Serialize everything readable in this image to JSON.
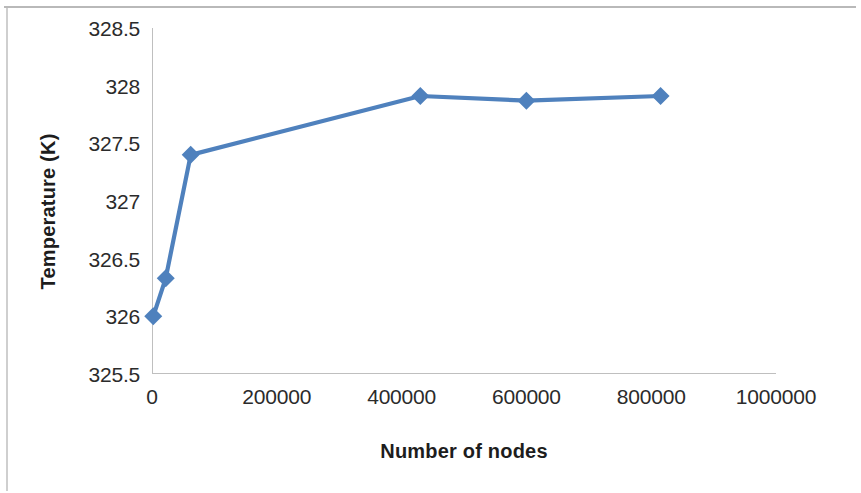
{
  "chart_data": {
    "type": "line",
    "title": "",
    "xlabel": "Number of nodes",
    "ylabel": "Temperature (K)",
    "xlim": [
      0,
      1000000
    ],
    "ylim": [
      325.5,
      328.5
    ],
    "xticks": [
      "0",
      "200000",
      "400000",
      "600000",
      "800000",
      "1000000"
    ],
    "xtick_values": [
      0,
      200000,
      400000,
      600000,
      800000,
      1000000
    ],
    "yticks": [
      "325.5",
      "326",
      "326.5",
      "327",
      "327.5",
      "328",
      "328.5"
    ],
    "ytick_values": [
      325.5,
      326,
      326.5,
      327,
      327.5,
      328,
      328.5
    ],
    "grid": false,
    "legend": false,
    "legend_position": "none",
    "marker": "diamond",
    "series": [
      {
        "name": "Temperature",
        "color": "#4F81BD",
        "x": [
          2000,
          22000,
          62000,
          430000,
          600000,
          815000
        ],
        "y": [
          326.0,
          326.33,
          327.4,
          327.91,
          327.87,
          327.91
        ]
      }
    ]
  },
  "figure": {
    "axis_color": "#bfbfbf",
    "text_color": "#2b2b2b",
    "background": "#ffffff"
  }
}
